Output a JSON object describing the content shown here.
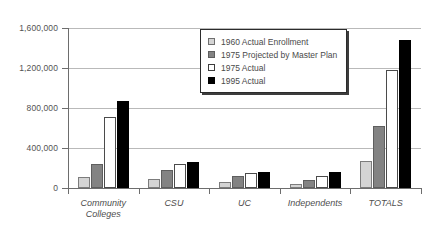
{
  "chart_data": {
    "type": "bar",
    "title": "",
    "xlabel": "",
    "ylabel": "",
    "ylim": [
      0,
      1600000
    ],
    "yticks": [
      "0",
      "400,000",
      "800,000",
      "1,200,000",
      "1,600,000"
    ],
    "ytick_values": [
      0,
      400000,
      800000,
      1200000,
      1600000
    ],
    "grid": true,
    "legend_position": "upper-center",
    "categories": [
      "Community\nColleges",
      "CSU",
      "UC",
      "Independents",
      "TOTALS"
    ],
    "series": [
      {
        "name": "1960 Actual Enrollment",
        "color": "#d4d4d4",
        "values": [
          110000,
          90000,
          65000,
          45000,
          270000
        ]
      },
      {
        "name": "1975 Projected by Master Plan",
        "color": "#838383",
        "values": [
          240000,
          185000,
          125000,
          80000,
          620000
        ]
      },
      {
        "name": "1975 Actual",
        "color": "#ffffff",
        "values": [
          710000,
          240000,
          150000,
          125000,
          1180000
        ]
      },
      {
        "name": "1995 Actual",
        "color": "#000000",
        "values": [
          870000,
          265000,
          160000,
          160000,
          1480000
        ]
      }
    ]
  },
  "legend": {
    "items": [
      "1960 Actual Enrollment",
      "1975 Projected by Master Plan",
      "1975 Actual",
      "1995 Actual"
    ]
  }
}
